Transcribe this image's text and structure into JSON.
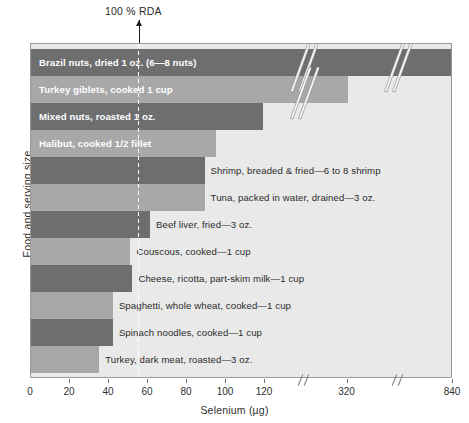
{
  "chart_data": {
    "type": "bar",
    "orientation": "horizontal",
    "title": "",
    "xlabel": "Selenium (µg)",
    "ylabel": "Food and serving size",
    "xlim": [
      0,
      840
    ],
    "grid": false,
    "legend": null,
    "axis_breaks": [
      "between 120 and 320",
      "between 320 and 840"
    ],
    "annotations": [
      {
        "label": "100 % RDA",
        "value": 55,
        "style": "arrow-with-dashed-line"
      }
    ],
    "xticks": [
      0,
      20,
      40,
      60,
      80,
      100,
      120,
      320,
      840
    ],
    "xtick_labels": [
      "0",
      "20",
      "40",
      "60",
      "80",
      "100",
      "120",
      "320",
      "840"
    ],
    "categories": [
      "Brazil nuts, dried 1 oz. (6—8 nuts)",
      "Turkey giblets, cooked 1 cup",
      "Mixed nuts, roasted 1 oz.",
      "Halibut, cooked 1/2 fillet",
      "Shrimp, breaded & fried—6 to 8 shrimp",
      "Tuna, packed in water, drained—3 oz.",
      "Beef liver, fried—3 oz.",
      "Couscous, cooked—1 cup",
      "Cheese, ricotta, part-skim milk—1 cup",
      "Spaghetti, whole wheat, cooked—1 cup",
      "Spinach noodles, cooked—1 cup",
      "Turkey, dark meat, roasted—3 oz."
    ],
    "values": [
      840,
      320,
      119,
      95,
      89,
      89,
      61,
      51,
      52,
      42,
      42,
      35
    ],
    "bar_colors": [
      "#6e6e6e",
      "#a8a8a8",
      "#6e6e6e",
      "#a8a8a8",
      "#6e6e6e",
      "#a8a8a8",
      "#6e6e6e",
      "#a8a8a8",
      "#6e6e6e",
      "#a8a8a8",
      "#6e6e6e",
      "#a8a8a8"
    ],
    "label_placement": [
      "inside",
      "inside",
      "inside",
      "inside",
      "outside",
      "outside",
      "outside",
      "outside",
      "outside",
      "outside",
      "outside",
      "outside"
    ]
  },
  "colors": {
    "plot_background": "#e9e9e9",
    "bar_dark": "#6e6e6e",
    "bar_light": "#a8a8a8",
    "page_background": "#ffffff",
    "axis": "#8f8f8f",
    "text": "#2f2f2f",
    "inside_label_text": "#ffffff"
  }
}
